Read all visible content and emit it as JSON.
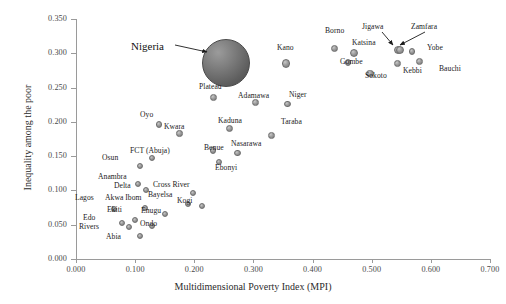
{
  "chart_data": {
    "type": "scatter",
    "title": "",
    "xlabel": "Multidimensional Poverty Index (MPI)",
    "ylabel": "Inequality among the poor",
    "xlim": [
      0.0,
      0.7
    ],
    "ylim": [
      0.0,
      0.35
    ],
    "xticks": [
      "0.000",
      "0.100",
      "0.200",
      "0.300",
      "0.400",
      "0.500",
      "0.600",
      "0.700"
    ],
    "yticks": [
      "0.000",
      "0.050",
      "0.100",
      "0.150",
      "0.200",
      "0.250",
      "0.300",
      "0.350"
    ],
    "grid": false,
    "legend": null,
    "point_color": "#8c8c8c",
    "highlight_color": "#5f5f5f",
    "annotations": [
      {
        "name": "nigeria-callout",
        "text": "Nigeria",
        "points_to": "Nigeria"
      },
      {
        "name": "jigawa-callout",
        "text": "Jigawa",
        "points_to": "Jigawa"
      },
      {
        "name": "zamfara-callout",
        "text": "Zamfara",
        "points_to": "Zamfara"
      }
    ],
    "points": [
      {
        "label": "Nigeria",
        "x": 0.254,
        "y": 0.286,
        "highlight": true,
        "size": 24,
        "lx": 131,
        "ly": 40
      },
      {
        "label": "Kano",
        "x": 0.355,
        "y": 0.285,
        "size": 4.2,
        "lx": 277,
        "ly": 43
      },
      {
        "label": "Borno",
        "x": 0.437,
        "y": 0.307,
        "size": 3.6,
        "lx": 325,
        "ly": 26
      },
      {
        "label": "Katsina",
        "x": 0.47,
        "y": 0.3,
        "size": 4.0,
        "lx": 352,
        "ly": 38
      },
      {
        "label": "Jigawa",
        "x": 0.544,
        "y": 0.305,
        "size": 4.0,
        "lx": 362,
        "ly": 22
      },
      {
        "label": "Zamfara",
        "x": 0.548,
        "y": 0.305,
        "size": 4.0,
        "lx": 411,
        "ly": 22
      },
      {
        "label": "Yobe",
        "x": 0.568,
        "y": 0.303,
        "size": 3.4,
        "lx": 427,
        "ly": 43
      },
      {
        "label": "Gombe",
        "x": 0.46,
        "y": 0.287,
        "size": 3.4,
        "lx": 340,
        "ly": 57
      },
      {
        "label": "Kebbi",
        "x": 0.543,
        "y": 0.285,
        "size": 3.4,
        "lx": 403,
        "ly": 66
      },
      {
        "label": "Bauchi",
        "x": 0.581,
        "y": 0.288,
        "size": 3.4,
        "lx": 439,
        "ly": 64
      },
      {
        "label": "Sokoto",
        "x": 0.497,
        "y": 0.271,
        "size": 3.6,
        "lx": 365,
        "ly": 71
      },
      {
        "label": "Plateau",
        "x": 0.233,
        "y": 0.236,
        "size": 3.4,
        "lx": 199,
        "ly": 82
      },
      {
        "label": "Adamawa",
        "x": 0.303,
        "y": 0.228,
        "size": 3.4,
        "lx": 238,
        "ly": 91
      },
      {
        "label": "Niger",
        "x": 0.357,
        "y": 0.226,
        "size": 3.4,
        "lx": 289,
        "ly": 90
      },
      {
        "label": "Oyo",
        "x": 0.14,
        "y": 0.196,
        "size": 3.2,
        "lx": 140,
        "ly": 110
      },
      {
        "label": "Kwara",
        "x": 0.175,
        "y": 0.183,
        "size": 3.2,
        "lx": 164,
        "ly": 122
      },
      {
        "label": "Kaduna",
        "x": 0.26,
        "y": 0.19,
        "size": 3.6,
        "lx": 218,
        "ly": 116
      },
      {
        "label": "Taraba",
        "x": 0.33,
        "y": 0.18,
        "size": 3.4,
        "lx": 281,
        "ly": 117
      },
      {
        "label": "Benue",
        "x": 0.232,
        "y": 0.158,
        "size": 3.2,
        "lx": 204,
        "ly": 143
      },
      {
        "label": "Nasarawa",
        "x": 0.273,
        "y": 0.155,
        "size": 3.2,
        "lx": 231,
        "ly": 139
      },
      {
        "label": "Ebonyi",
        "x": 0.242,
        "y": 0.141,
        "size": 3.0,
        "lx": 215,
        "ly": 163
      },
      {
        "label": "FCT (Abuja)",
        "x": 0.128,
        "y": 0.148,
        "size": 3.0,
        "lx": 130,
        "ly": 146
      },
      {
        "label": "Osun",
        "x": 0.109,
        "y": 0.136,
        "size": 3.0,
        "lx": 102,
        "ly": 153
      },
      {
        "label": "Anambra",
        "x": 0.104,
        "y": 0.11,
        "size": 3.0,
        "lx": 98,
        "ly": 172
      },
      {
        "label": "Delta",
        "x": 0.118,
        "y": 0.1,
        "size": 3.0,
        "lx": 114,
        "ly": 181
      },
      {
        "label": "Cross River",
        "x": 0.198,
        "y": 0.096,
        "size": 3.0,
        "lx": 153,
        "ly": 180
      },
      {
        "label": "Bayelsa",
        "x": 0.19,
        "y": 0.08,
        "size": 3.0,
        "lx": 148,
        "ly": 190
      },
      {
        "label": "Kogi",
        "x": 0.213,
        "y": 0.078,
        "size": 3.0,
        "lx": 177,
        "ly": 196
      },
      {
        "label": "Lagos",
        "x": 0.065,
        "y": 0.073,
        "size": 3.0,
        "lx": 75,
        "ly": 193
      },
      {
        "label": "Akwa Ibom",
        "x": 0.116,
        "y": 0.075,
        "size": 3.0,
        "lx": 105,
        "ly": 193
      },
      {
        "label": "Ekiti",
        "x": 0.1,
        "y": 0.057,
        "size": 3.0,
        "lx": 107,
        "ly": 205
      },
      {
        "label": "Enugu",
        "x": 0.15,
        "y": 0.066,
        "size": 3.0,
        "lx": 141,
        "ly": 206
      },
      {
        "label": "Edo",
        "x": 0.078,
        "y": 0.053,
        "size": 3.0,
        "lx": 83,
        "ly": 213
      },
      {
        "label": "Rivers",
        "x": 0.09,
        "y": 0.047,
        "size": 3.0,
        "lx": 79,
        "ly": 222
      },
      {
        "label": "Ondo",
        "x": 0.128,
        "y": 0.048,
        "size": 3.0,
        "lx": 140,
        "ly": 219
      },
      {
        "label": "Abia",
        "x": 0.108,
        "y": 0.034,
        "size": 3.0,
        "lx": 106,
        "ly": 232
      }
    ]
  }
}
